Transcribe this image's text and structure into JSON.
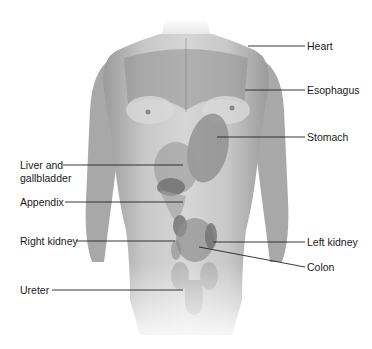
{
  "figure": {
    "colors": {
      "skin_light": "#d9d9d9",
      "skin_mid": "#b3b3b3",
      "organ": "#8c8c8c",
      "organ_dark": "#6e6e6e",
      "leader": "#222222",
      "text": "#1a1a1a"
    }
  },
  "labels": {
    "heart": "Heart",
    "esophagus": "Esophagus",
    "stomach": "Stomach",
    "liver_line1": "Liver and",
    "liver_line2": "gallbladder",
    "appendix": "Appendix",
    "right_kidney": "Right kidney",
    "left_kidney": "Left kidney",
    "colon": "Colon",
    "ureter": "Ureter"
  }
}
